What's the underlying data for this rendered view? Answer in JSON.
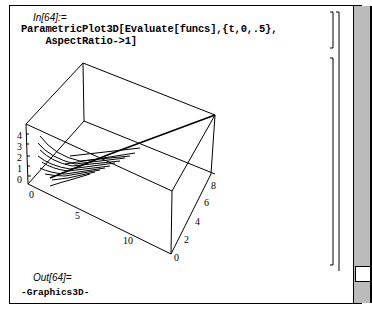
{
  "cell_input": {
    "label": "In[64]:=",
    "code_line1": "ParametricPlot3D[Evaluate[funcs],{t,0,.5},",
    "code_line2": "    AspectRatio->1]"
  },
  "cell_output": {
    "label": "Out[64]=",
    "value": "-Graphics3D-"
  },
  "plot": {
    "z_ticks": [
      "4",
      "3",
      "2",
      "1",
      "0"
    ],
    "x_ticks": [
      "0",
      "5",
      "10"
    ],
    "y_ticks": [
      "0",
      "2",
      "4",
      "6",
      "8"
    ]
  },
  "scrollbar": {
    "thumb_position": "bottom"
  }
}
